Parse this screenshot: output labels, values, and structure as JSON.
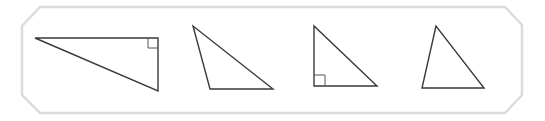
{
  "colors": {
    "frame_stroke": "#dcdcdc",
    "shape_stroke": "#3a3a3a",
    "background": "#ffffff"
  },
  "frame": {
    "points": "40,7 505,7 522,25 522,95 505,113 40,113 22,95 22,26"
  },
  "triangles": [
    {
      "name": "right-triangle-wide",
      "type": "right",
      "points": "35,38 158,38 158,91",
      "right_angle_marker": "148,38 148,48 158,48"
    },
    {
      "name": "obtuse-triangle",
      "type": "obtuse",
      "points": "193,26 210,89 273,89",
      "right_angle_marker": null
    },
    {
      "name": "right-triangle-upright",
      "type": "right",
      "points": "314,26 314,86 377,86",
      "right_angle_marker": "314,75 325,75 325,86"
    },
    {
      "name": "acute-triangle",
      "type": "acute",
      "points": "436,26 422,88 484,88",
      "right_angle_marker": null
    }
  ]
}
